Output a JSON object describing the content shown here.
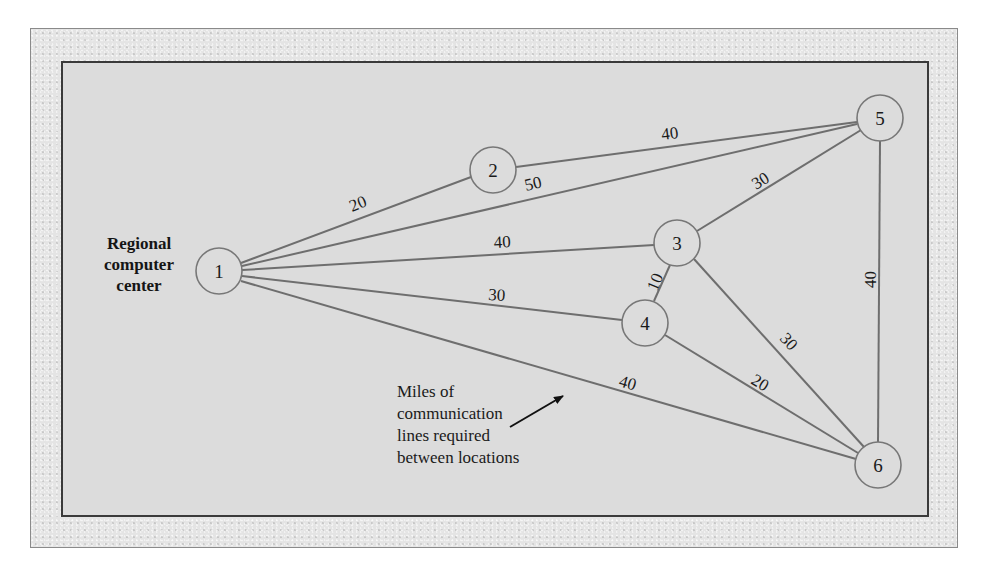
{
  "diagram": {
    "type": "weighted-network",
    "center_label_lines": [
      "Regional",
      "computer",
      "center"
    ],
    "note_lines": [
      "Miles of",
      "communication",
      "lines required",
      "between locations"
    ],
    "colors": {
      "edge": "#6e6e6e",
      "node_stroke": "#777777",
      "node_fill": "#dcdcdc",
      "inner_bg": "#dcdcdc",
      "frame_bg": "#e4e4e4",
      "text": "#1a1a1a"
    },
    "nodes": [
      {
        "id": "1",
        "label": "1"
      },
      {
        "id": "2",
        "label": "2"
      },
      {
        "id": "3",
        "label": "3"
      },
      {
        "id": "4",
        "label": "4"
      },
      {
        "id": "5",
        "label": "5"
      },
      {
        "id": "6",
        "label": "6"
      }
    ],
    "edges": [
      {
        "from": "1",
        "to": "2",
        "weight": "20"
      },
      {
        "from": "1",
        "to": "5",
        "weight": "50"
      },
      {
        "from": "1",
        "to": "3",
        "weight": "40"
      },
      {
        "from": "1",
        "to": "4",
        "weight": "30"
      },
      {
        "from": "1",
        "to": "6",
        "weight": "40"
      },
      {
        "from": "2",
        "to": "5",
        "weight": "40"
      },
      {
        "from": "3",
        "to": "5",
        "weight": "30"
      },
      {
        "from": "3",
        "to": "4",
        "weight": "10"
      },
      {
        "from": "3",
        "to": "6",
        "weight": "30"
      },
      {
        "from": "4",
        "to": "6",
        "weight": "20"
      },
      {
        "from": "5",
        "to": "6",
        "weight": "40"
      }
    ],
    "unit": "miles"
  }
}
